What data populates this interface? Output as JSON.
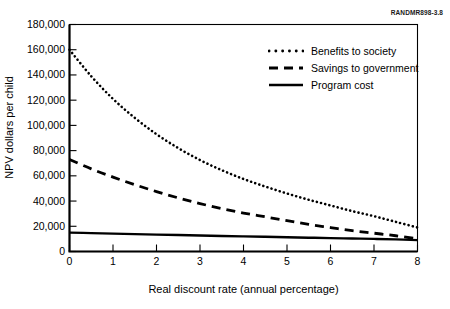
{
  "figure": {
    "source_label": "RANDMR898-3.8",
    "background_color": "#ffffff",
    "line_color": "#000000"
  },
  "chart_data": {
    "type": "line",
    "title": "",
    "subtitle": "",
    "xlabel": "Real discount rate (annual percentage)",
    "ylabel": "NPV dollars per child",
    "xlim": [
      0,
      8
    ],
    "ylim": [
      0,
      180000
    ],
    "grid": false,
    "legend_position": "upper-right-inside",
    "xticks": [
      "0",
      "1",
      "2",
      "3",
      "4",
      "5",
      "6",
      "7",
      "8"
    ],
    "xtick_values": [
      0,
      1,
      2,
      3,
      4,
      5,
      6,
      7,
      8
    ],
    "yticks": [
      "0",
      "20,000",
      "40,000",
      "60,000",
      "80,000",
      "100,000",
      "120,000",
      "140,000",
      "160,000",
      "180,000"
    ],
    "ytick_values": [
      0,
      20000,
      40000,
      60000,
      80000,
      100000,
      120000,
      140000,
      160000,
      180000
    ],
    "x": [
      0,
      0.5,
      1,
      1.5,
      2,
      2.5,
      3,
      3.5,
      4,
      4.5,
      5,
      5.5,
      6,
      6.5,
      7,
      7.5,
      8
    ],
    "series": [
      {
        "name": "Benefits to society",
        "style": "dotted",
        "values": [
          160000,
          139000,
          121000,
          106000,
          93000,
          82000,
          72500,
          64500,
          57500,
          51500,
          46000,
          41000,
          36500,
          32000,
          28000,
          23500,
          19000
        ]
      },
      {
        "name": "Savings to government",
        "style": "dashed",
        "values": [
          73000,
          65500,
          59000,
          53000,
          47500,
          42500,
          38000,
          34000,
          30500,
          27500,
          24500,
          21500,
          19000,
          16500,
          14500,
          12500,
          10000
        ]
      },
      {
        "name": "Program cost",
        "style": "solid",
        "values": [
          15000,
          14600,
          14200,
          13800,
          13400,
          13050,
          12700,
          12350,
          12000,
          11650,
          11300,
          10950,
          10600,
          10300,
          10000,
          9600,
          9000
        ]
      }
    ]
  },
  "legend": {
    "items": [
      {
        "label": "Benefits to society",
        "style": "dotted"
      },
      {
        "label": "Savings to government",
        "style": "dashed"
      },
      {
        "label": "Program cost",
        "style": "solid"
      }
    ]
  }
}
